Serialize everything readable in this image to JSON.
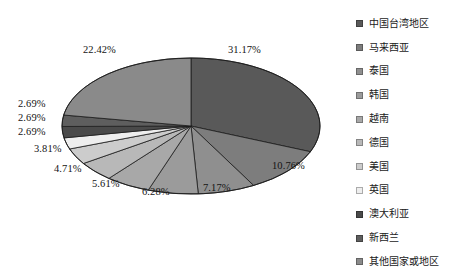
{
  "chart_data": {
    "type": "pie",
    "title": "",
    "subtitle": "",
    "xlabel": "",
    "ylabel": "",
    "legend_position": "right",
    "grid": false,
    "value_unit": "%",
    "categories": [
      "中国台湾地区",
      "马来西亚",
      "泰国",
      "韩国",
      "越南",
      "德国",
      "美国",
      "英国",
      "澳大利亚",
      "新西兰",
      "其他国家或地区"
    ],
    "values": [
      31.17,
      10.76,
      7.17,
      6.28,
      5.61,
      4.71,
      3.81,
      2.69,
      2.69,
      2.69,
      22.42
    ],
    "data_labels": [
      "31.17%",
      "10.76%",
      "7.17%",
      "6.28%",
      "5.61%",
      "4.71%",
      "3.81%",
      "2.69%",
      "2.69%",
      "2.69%",
      "22.42%"
    ],
    "slice_colors": [
      "#595959",
      "#7d7d7d",
      "#8f8f8f",
      "#9b9b9b",
      "#a8a8a8",
      "#b8b8b8",
      "#cccccc",
      "#eeeeee",
      "#4a4a4a",
      "#5e5e5e",
      "#8a8a8a"
    ]
  },
  "legend": {
    "items": [
      {
        "label": "中国台湾地区",
        "color": "#595959"
      },
      {
        "label": "马来西亚",
        "color": "#7d7d7d"
      },
      {
        "label": "泰国",
        "color": "#8f8f8f"
      },
      {
        "label": "韩国",
        "color": "#9b9b9b"
      },
      {
        "label": "越南",
        "color": "#a8a8a8"
      },
      {
        "label": "德国",
        "color": "#b8b8b8"
      },
      {
        "label": "美国",
        "color": "#cccccc"
      },
      {
        "label": "英国",
        "color": "#eeeeee"
      },
      {
        "label": "澳大利亚",
        "color": "#4a4a4a"
      },
      {
        "label": "新西兰",
        "color": "#5e5e5e"
      },
      {
        "label": "其他国家或地区",
        "color": "#8a8a8a"
      }
    ]
  },
  "labels": {
    "p0": "31.17%",
    "p1": "10.76%",
    "p2": "7.17%",
    "p3": "6.28%",
    "p4": "5.61%",
    "p5": "4.71%",
    "p6": "3.81%",
    "p7": "2.69%",
    "p8": "2.69%",
    "p9": "2.69%",
    "p10": "22.42%"
  }
}
